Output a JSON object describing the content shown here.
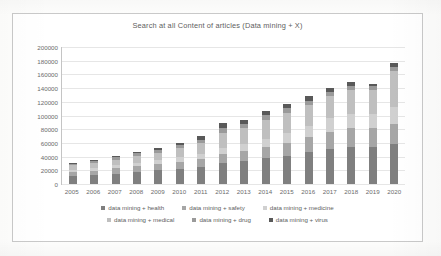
{
  "chart_data": {
    "type": "bar",
    "subtype": "stacked-column",
    "title": "Search at all Content of articles (Data mining + X)",
    "xlabel": "",
    "ylabel": "",
    "ylim": [
      0,
      200000
    ],
    "ytick_step": 20000,
    "yticks": [
      "200000",
      "180000",
      "160000",
      "140000",
      "120000",
      "100000",
      "80000",
      "60000",
      "40000",
      "20000",
      "0"
    ],
    "grid": true,
    "legend_position": "bottom",
    "categories": [
      "2005",
      "2006",
      "2007",
      "2008",
      "2009",
      "2010",
      "2011",
      "2012",
      "2013",
      "2014",
      "2015",
      "2016",
      "2017",
      "2018",
      "2019",
      "2020"
    ],
    "series": [
      {
        "name": "data mining + health",
        "color": "#7f7f7f",
        "values": [
          11000,
          13000,
          15000,
          17500,
          20000,
          22000,
          25000,
          30000,
          33000,
          37000,
          41000,
          46000,
          51000,
          54000,
          54000,
          58000
        ]
      },
      {
        "name": "data mining + safety",
        "color": "#a6a6a6",
        "values": [
          6000,
          6500,
          7500,
          8500,
          9000,
          10000,
          11000,
          13000,
          14500,
          17000,
          19000,
          22000,
          25000,
          27000,
          26500,
          29000
        ]
      },
      {
        "name": "data mining + medicine",
        "color": "#d0d0d0",
        "values": [
          3500,
          4000,
          4500,
          5000,
          5500,
          6500,
          7500,
          9000,
          10000,
          12000,
          14000,
          16000,
          19000,
          21000,
          21000,
          24000
        ]
      },
      {
        "name": "data mining + medical",
        "color": "#bfbfbf",
        "values": [
          6500,
          7500,
          8500,
          10000,
          11000,
          13000,
          16000,
          22000,
          23000,
          27000,
          29000,
          31000,
          33000,
          35000,
          35000,
          53000
        ]
      },
      {
        "name": "data mining + drug",
        "color": "#9a9a9a",
        "values": [
          2500,
          2800,
          3200,
          3500,
          4000,
          4500,
          5000,
          6500,
          6500,
          7000,
          7500,
          6000,
          5500,
          5500,
          5000,
          5000
        ]
      },
      {
        "name": "data mining + virus",
        "color": "#595959",
        "values": [
          1500,
          1700,
          2000,
          2300,
          2500,
          3000,
          5500,
          7500,
          6500,
          6000,
          5000,
          6000,
          5000,
          5000,
          4000,
          7000
        ]
      }
    ],
    "totals": [
      31000,
      35500,
      40700,
      46800,
      52000,
      59000,
      70000,
      88000,
      93500,
      106000,
      115500,
      127000,
      138500,
      147500,
      145500,
      176000
    ]
  }
}
